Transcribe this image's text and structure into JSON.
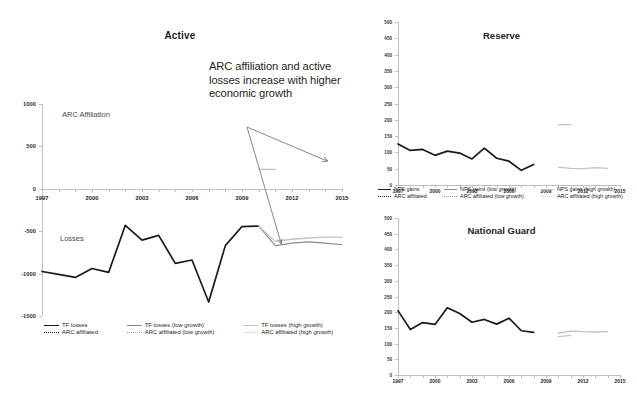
{
  "figure": {
    "callout_text": "ARC affiliation and active losses increase with higher economic growth",
    "colors": {
      "series_actual": "#1a1a1a",
      "series_low_growth": "#8c8c8c",
      "series_high_growth": "#c2c2c2",
      "axis": "#bfbfbf",
      "text": "#231f20",
      "inplot_label": "#4a4a4a"
    }
  },
  "panels": {
    "active": {
      "title": "Active",
      "inplot_labels": {
        "affiliation": "ARC Affiliation",
        "losses": "Losses"
      },
      "legend": [
        {
          "label": "TF losses",
          "style": "solid-dark"
        },
        {
          "label": "TF losses (low growth)",
          "style": "solid-mid"
        },
        {
          "label": "TF losses (high growth)",
          "style": "solid-light"
        },
        {
          "label": "ARC affiliated",
          "style": "dot-dark"
        },
        {
          "label": "ARC affiliated (low growth)",
          "style": "dot-mid"
        },
        {
          "label": "ARC affiliated (high growth)",
          "style": "dot-light"
        }
      ]
    },
    "reserve": {
      "title": "Reserve",
      "legend": [
        {
          "label": "NPS gains",
          "style": "solid-dark"
        },
        {
          "label": "NPS gains (low growth)",
          "style": "solid-mid"
        },
        {
          "label": "NPS gains (high growth)",
          "style": "solid-light"
        },
        {
          "label": "ARC affiliated",
          "style": "dot-dark"
        },
        {
          "label": "ARC affiliated (low growth)",
          "style": "dot-mid"
        },
        {
          "label": "ARC affiliated (high growth)",
          "style": "dot-light"
        }
      ]
    },
    "guard": {
      "title": "National Guard"
    }
  },
  "chart_data": [
    {
      "id": "active",
      "type": "line",
      "title": "Active",
      "xlabel": "",
      "ylabel": "",
      "xlim": [
        1997,
        2015
      ],
      "ylim": [
        -1500,
        1000
      ],
      "xticks": [
        1997,
        2000,
        2003,
        2006,
        2009,
        2012,
        2015
      ],
      "yticks": [
        1000,
        500,
        0,
        -500,
        -1000,
        -1500
      ],
      "grid": false,
      "legend_position": "below-axes",
      "annotations": [
        {
          "text": "ARC Affiliation",
          "x": 1999.4,
          "y": 775
        },
        {
          "text": "Losses",
          "x": 1999.0,
          "y": -640
        },
        {
          "text": "ARC affiliation and active losses increase with higher economic growth",
          "x": 2007.6,
          "y": 900
        }
      ],
      "series": [
        {
          "name": "TF losses",
          "style": "solid-dark",
          "x": [
            1997,
            1998,
            1999,
            2000,
            2001,
            2002,
            2003,
            2004,
            2005,
            2006,
            2007,
            2008,
            2009,
            2010
          ],
          "values": [
            -975,
            -1010,
            -1045,
            -940,
            -985,
            -430,
            -605,
            -550,
            -880,
            -840,
            -1335,
            -670,
            -445,
            -440
          ]
        },
        {
          "name": "TF losses (low growth)",
          "style": "solid-mid",
          "x": [
            2010,
            2011,
            2012,
            2013,
            2014,
            2015
          ],
          "values": [
            -440,
            -670,
            -640,
            -625,
            -640,
            -660
          ]
        },
        {
          "name": "TF losses (high growth)",
          "style": "solid-light",
          "x": [
            2010,
            2011,
            2012,
            2013,
            2014,
            2015
          ],
          "values": [
            -440,
            -620,
            -595,
            -580,
            -570,
            -570
          ]
        },
        {
          "name": "ARC affiliated (high growth)",
          "style": "solid-light",
          "x": [
            2010,
            2011
          ],
          "values": [
            230,
            230
          ]
        }
      ]
    },
    {
      "id": "reserve",
      "type": "line",
      "title": "Reserve",
      "xlabel": "",
      "ylabel": "",
      "xlim": [
        1997,
        2015
      ],
      "ylim": [
        0,
        500
      ],
      "xticks": [
        1997,
        2000,
        2003,
        2006,
        2009,
        2012,
        2015
      ],
      "yticks": [
        0,
        50,
        100,
        150,
        200,
        250,
        300,
        350,
        400,
        450,
        500
      ],
      "grid": false,
      "legend_position": "below-axes",
      "series": [
        {
          "name": "NPS gains",
          "style": "solid-dark",
          "x": [
            1997,
            1998,
            1999,
            2000,
            2001,
            2002,
            2003,
            2004,
            2005,
            2006,
            2007,
            2008
          ],
          "values": [
            126,
            106,
            109,
            91,
            104,
            98,
            80,
            113,
            82,
            73,
            45,
            63
          ]
        },
        {
          "name": "NPS gains (high growth)",
          "style": "solid-light",
          "x": [
            2010,
            2011
          ],
          "values": [
            185,
            185
          ]
        },
        {
          "name": "ARC affiliated (high growth)",
          "style": "solid-light",
          "x": [
            2010,
            2011,
            2012,
            2013,
            2014
          ],
          "values": [
            55,
            51,
            50,
            53,
            51
          ]
        }
      ]
    },
    {
      "id": "guard",
      "type": "line",
      "title": "National Guard",
      "xlabel": "",
      "ylabel": "",
      "xlim": [
        1997,
        2015
      ],
      "ylim": [
        0,
        500
      ],
      "xticks": [
        1997,
        2000,
        2003,
        2006,
        2009,
        2012,
        2015
      ],
      "yticks": [
        0,
        50,
        100,
        150,
        200,
        250,
        300,
        350,
        400,
        450,
        500
      ],
      "grid": false,
      "legend_position": "none",
      "series": [
        {
          "name": "NPS gains",
          "style": "solid-dark",
          "x": [
            1997,
            1998,
            1999,
            2000,
            2001,
            2002,
            2003,
            2004,
            2005,
            2006,
            2007,
            2008
          ],
          "values": [
            205,
            145,
            167,
            161,
            214,
            196,
            168,
            177,
            162,
            181,
            141,
            136
          ]
        },
        {
          "name": "NPS gains (high growth)",
          "style": "solid-light",
          "x": [
            2010,
            2011,
            2012,
            2013,
            2014
          ],
          "values": [
            133,
            140,
            138,
            137,
            138
          ]
        },
        {
          "name": "ARC affiliated (high growth)",
          "style": "solid-light",
          "x": [
            2010,
            2011
          ],
          "values": [
            122,
            126
          ]
        }
      ]
    }
  ]
}
